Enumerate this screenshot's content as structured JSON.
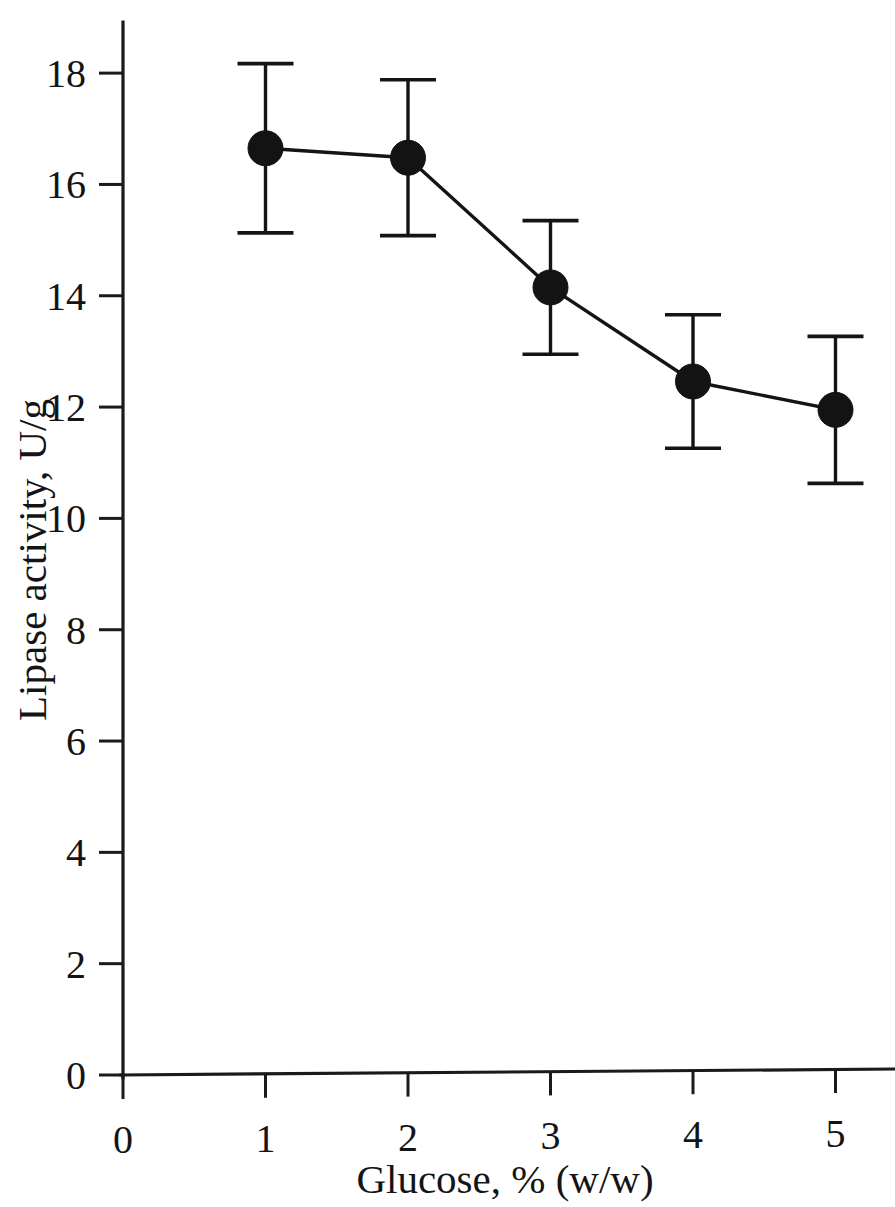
{
  "chart_data": {
    "type": "line",
    "title": "",
    "subtitle": "",
    "xlabel": "Glucose, % (w/w)",
    "ylabel": "Lipase activity, U/g",
    "xlim": [
      0,
      5.45
    ],
    "ylim": [
      0,
      18.9
    ],
    "x_ticks": [
      0,
      1,
      2,
      3,
      4,
      5
    ],
    "x_tick_labels": [
      "0",
      "1",
      "2",
      "3",
      "4",
      "5"
    ],
    "y_ticks": [
      0,
      2,
      4,
      6,
      8,
      10,
      12,
      14,
      16,
      18
    ],
    "y_tick_labels": [
      "0",
      "2",
      "4",
      "6",
      "8",
      "10",
      "12",
      "14",
      "16",
      "18"
    ],
    "grid": false,
    "legend": null,
    "legend_position": "none",
    "marker": "filled-circle",
    "marker_color": "#131313",
    "line_color": "#141414",
    "error_bars": true,
    "error_bar_style": "capped",
    "x": [
      1,
      2,
      3,
      4,
      5
    ],
    "values": [
      16.65,
      16.48,
      14.15,
      12.46,
      11.95
    ],
    "errors": [
      1.52,
      1.4,
      1.2,
      1.2,
      1.32
    ],
    "series": [
      {
        "name": "Lipase activity",
        "x": [
          1,
          2,
          3,
          4,
          5
        ],
        "values": [
          16.65,
          16.48,
          14.15,
          12.46,
          11.95
        ],
        "errors": [
          1.52,
          1.4,
          1.2,
          1.2,
          1.32
        ],
        "error_low": [
          15.13,
          15.08,
          12.95,
          11.26,
          10.63
        ],
        "error_high": [
          18.17,
          17.88,
          15.35,
          13.66,
          13.27
        ]
      }
    ],
    "annotations": []
  },
  "axes": {
    "x_title": "Glucose, % (w/w)",
    "y_title": "Lipase activity, U/g"
  }
}
